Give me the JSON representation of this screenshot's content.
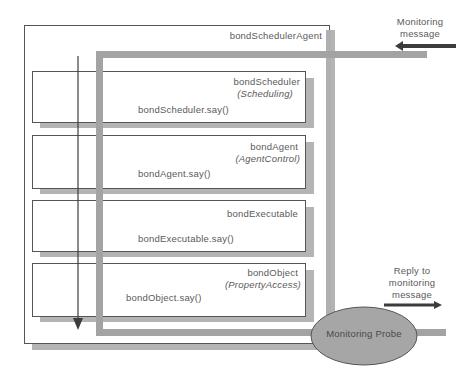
{
  "diagram": {
    "agent": {
      "label": "bondSchedulerAgent"
    },
    "layers": [
      {
        "name": "bondScheduler",
        "role": "(Scheduling)",
        "call": "bondScheduler.say()"
      },
      {
        "name": "bondAgent",
        "role": "(AgentControl)",
        "call": "bondAgent.say()"
      },
      {
        "name": "bondExecutable",
        "role": "",
        "call": "bondExecutable.say()"
      },
      {
        "name": "bondObject",
        "role": "(PropertyAccess)",
        "call": "bondObject.say()"
      }
    ],
    "monitoring_message": {
      "line1": "Monitoring",
      "line2": "message"
    },
    "reply": {
      "line1": "Reply to",
      "line2": "monitoring",
      "line3": "message"
    },
    "probe": {
      "label": "Monitoring Probe"
    },
    "colors": {
      "path_gray": "#a3a3a3",
      "shadow_gray": "#b4b4b4",
      "probe_fill": "#a6a6a6",
      "arrow_dark": "#3c3c3c",
      "border": "#555555"
    }
  }
}
